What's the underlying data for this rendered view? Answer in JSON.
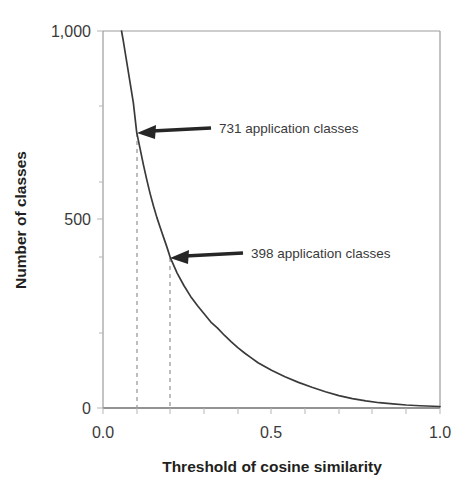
{
  "chart_data": {
    "type": "line",
    "title": "",
    "subtitle": "",
    "xlabel": "Threshold of cosine similarity",
    "ylabel": "Number of classes",
    "xlim": [
      0.0,
      1.0
    ],
    "ylim": [
      0,
      1000
    ],
    "xticks": [
      "0.0",
      "0.5",
      "1.0"
    ],
    "xtick_values": [
      0.0,
      0.5,
      1.0
    ],
    "yticks": [
      "0",
      "500",
      "1,000"
    ],
    "ytick_values": [
      0,
      500,
      1000
    ],
    "grid": false,
    "legend": "none",
    "series": [
      {
        "name": "Number of classes vs threshold",
        "x": [
          0.055,
          0.06,
          0.07,
          0.08,
          0.09,
          0.1,
          0.11,
          0.12,
          0.13,
          0.14,
          0.15,
          0.16,
          0.17,
          0.18,
          0.19,
          0.2,
          0.22,
          0.24,
          0.26,
          0.28,
          0.3,
          0.32,
          0.34,
          0.36,
          0.38,
          0.4,
          0.42,
          0.44,
          0.46,
          0.48,
          0.5,
          0.54,
          0.58,
          0.62,
          0.66,
          0.7,
          0.74,
          0.78,
          0.82,
          0.86,
          0.9,
          0.94,
          1.0
        ],
        "values": [
          1000,
          975,
          920,
          865,
          810,
          731,
          688,
          645,
          605,
          568,
          535,
          505,
          478,
          452,
          426,
          398,
          358,
          325,
          296,
          272,
          250,
          228,
          212,
          193,
          176,
          160,
          146,
          133,
          120,
          110,
          100,
          83,
          68,
          55,
          43,
          33,
          25,
          19,
          14,
          11,
          8,
          6,
          4
        ]
      }
    ],
    "annotations": [
      {
        "name": "731-annotation",
        "label": "731 application classes",
        "x": 0.1,
        "y": 731,
        "dashed_guide": true
      },
      {
        "name": "398-annotation",
        "label": "398 application classes",
        "x": 0.2,
        "y": 398,
        "dashed_guide": true
      }
    ],
    "colors": {
      "line": "#3a3a3a",
      "axis": "#8a8a8a",
      "guide": "#9a9a9a",
      "arrow": "#262626",
      "text": "#2b2b2b",
      "background": "#ffffff"
    }
  }
}
